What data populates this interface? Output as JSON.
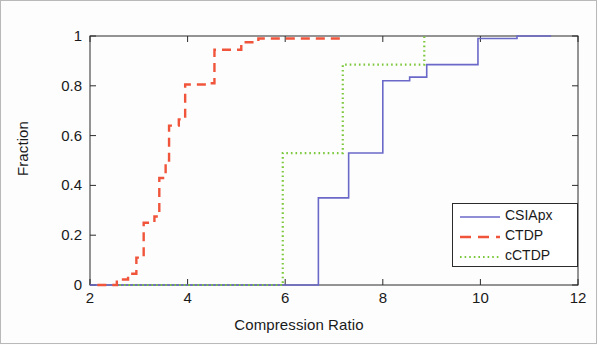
{
  "chart_data": {
    "type": "line",
    "title": "",
    "xlabel": "Compression Ratio",
    "ylabel": "Fraction",
    "xlim": [
      2,
      12
    ],
    "ylim": [
      0,
      1
    ],
    "xticks": [
      "2",
      "4",
      "6",
      "8",
      "10",
      "12"
    ],
    "yticks": [
      "1",
      "0.8",
      "0.6",
      "0.4",
      "0.2",
      "0"
    ],
    "ytick_values": [
      1,
      0.8,
      0.6,
      0.4,
      0.2,
      0
    ],
    "grid": false,
    "legend_position": "lower right",
    "series": [
      {
        "name": "CSIApx",
        "color": "#6a68c8",
        "style": "solid",
        "points": [
          [
            2.0,
            0.0
          ],
          [
            6.68,
            0.0
          ],
          [
            6.68,
            0.35
          ],
          [
            7.3,
            0.35
          ],
          [
            7.3,
            0.53
          ],
          [
            8.0,
            0.53
          ],
          [
            8.0,
            0.82
          ],
          [
            8.55,
            0.82
          ],
          [
            8.55,
            0.835
          ],
          [
            8.9,
            0.835
          ],
          [
            8.9,
            0.885
          ],
          [
            9.95,
            0.885
          ],
          [
            9.95,
            0.99
          ],
          [
            10.75,
            0.99
          ],
          [
            10.75,
            1.0
          ],
          [
            11.45,
            1.0
          ]
        ]
      },
      {
        "name": "CTDP",
        "color": "#f0553c",
        "style": "dashed",
        "points": [
          [
            2.15,
            0.0
          ],
          [
            2.55,
            0.0
          ],
          [
            2.55,
            0.022
          ],
          [
            2.78,
            0.022
          ],
          [
            2.78,
            0.045
          ],
          [
            2.95,
            0.045
          ],
          [
            2.95,
            0.11
          ],
          [
            3.1,
            0.11
          ],
          [
            3.1,
            0.25
          ],
          [
            3.32,
            0.25
          ],
          [
            3.32,
            0.275
          ],
          [
            3.42,
            0.275
          ],
          [
            3.42,
            0.43
          ],
          [
            3.55,
            0.43
          ],
          [
            3.55,
            0.5
          ],
          [
            3.62,
            0.5
          ],
          [
            3.62,
            0.64
          ],
          [
            3.82,
            0.64
          ],
          [
            3.82,
            0.665
          ],
          [
            3.95,
            0.665
          ],
          [
            3.95,
            0.805
          ],
          [
            4.45,
            0.805
          ],
          [
            4.45,
            0.81
          ],
          [
            4.55,
            0.81
          ],
          [
            4.55,
            0.945
          ],
          [
            5.1,
            0.945
          ],
          [
            5.1,
            0.975
          ],
          [
            5.45,
            0.975
          ],
          [
            5.45,
            0.99
          ],
          [
            7.15,
            0.99
          ]
        ]
      },
      {
        "name": "cCTDP",
        "color": "#7cc83c",
        "style": "dotted",
        "points": [
          [
            2.6,
            0.0
          ],
          [
            5.95,
            0.0
          ],
          [
            5.95,
            0.53
          ],
          [
            7.18,
            0.53
          ],
          [
            7.18,
            0.885
          ],
          [
            8.85,
            0.885
          ],
          [
            8.85,
            1.0
          ]
        ]
      }
    ]
  },
  "legend": {
    "entries": [
      {
        "label": "CSIApx"
      },
      {
        "label": "CTDP"
      },
      {
        "label": "cCTDP"
      }
    ]
  }
}
